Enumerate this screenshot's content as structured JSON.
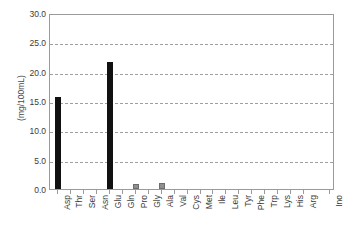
{
  "chart_data": {
    "type": "bar",
    "title": "",
    "xlabel": "",
    "ylabel": "(mg/100mL)",
    "ylim": [
      0.0,
      30.0
    ],
    "ytick_labels": [
      "0.0",
      "5.0",
      "10.0",
      "15.0",
      "20.0",
      "25.0",
      "30.0"
    ],
    "ytick_values": [
      0.0,
      5.0,
      10.0,
      15.0,
      20.0,
      25.0,
      30.0
    ],
    "grid": "horizontal-dashed",
    "legend": "none",
    "categories": [
      "Asp",
      "Thr",
      "Ser",
      "Asn",
      "Glu",
      "Gln",
      "Pro",
      "Gly",
      "Ala",
      "Val",
      "Cys",
      "Met",
      "Ile",
      "Leu",
      "Tyr",
      "Phe",
      "Trp",
      "Lys",
      "His",
      "Arg",
      "Ino"
    ],
    "values": [
      15.6,
      0.0,
      0.0,
      0.0,
      21.7,
      0.0,
      0.8,
      0.0,
      1.1,
      0.0,
      0.0,
      0.0,
      0.0,
      0.0,
      0.0,
      0.0,
      0.0,
      0.0,
      0.0,
      0.0,
      0.0
    ],
    "bar_colors": [
      "#111111",
      "#111111",
      "#111111",
      "#111111",
      "#111111",
      "#111111",
      "#8f8f8f",
      "#111111",
      "#8f8f8f",
      "#111111",
      "#111111",
      "#111111",
      "#111111",
      "#111111",
      "#111111",
      "#111111",
      "#111111",
      "#111111",
      "#111111",
      "#111111",
      "#111111"
    ],
    "axis_color": "#9a9a9a",
    "grid_color": "#9f9f9f",
    "text_color": "#3c3c3c",
    "background": "#ffffff"
  }
}
